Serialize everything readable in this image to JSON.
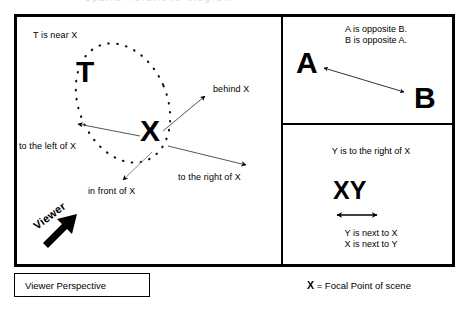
{
  "figure": {
    "title_artifact": "spatial relations diagram",
    "focal_letter": "X"
  },
  "scene_panel": {
    "name": "viewer-perspective-scene",
    "near_label": "T is near X",
    "letter_t": "T",
    "letter_x": "X",
    "arrows": [
      {
        "id": "behind",
        "label": "behind X"
      },
      {
        "id": "right",
        "label": "to the right of X"
      },
      {
        "id": "front",
        "label": "in front of X"
      },
      {
        "id": "left",
        "label": "to the left of X"
      }
    ],
    "viewer_label": "Viewer"
  },
  "opposite_panel": {
    "name": "opposite-relation",
    "line1": "A is opposite B.",
    "line2": "B is opposite A.",
    "letter_a": "A",
    "letter_b": "B"
  },
  "next_to_panel": {
    "name": "next-to-relation",
    "heading": "Y is to the right of X",
    "letters": "XY",
    "line1": "Y is next to X",
    "line2": "X is next to Y"
  },
  "captions": {
    "viewer_perspective": "Viewer Perspective",
    "focal_prefix": "X",
    "focal_rest": " = Focal Point of scene"
  },
  "colors": {
    "ink": "#000000",
    "paper": "#ffffff"
  }
}
